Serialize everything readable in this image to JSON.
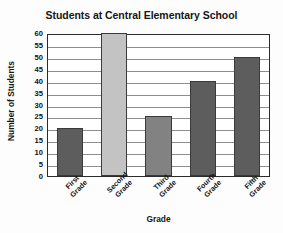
{
  "chart_data": {
    "type": "bar",
    "title": "Students at Central Elementary School",
    "xlabel": "Grade",
    "ylabel": "Number of Students",
    "categories": [
      "First Grade",
      "Second Grade",
      "Third Grade",
      "Fourth Grade",
      "Fifth Grade"
    ],
    "category_lines": [
      [
        "First",
        "Grade"
      ],
      [
        "Second",
        "Grade"
      ],
      [
        "Third",
        "Grade"
      ],
      [
        "Fourth",
        "Grade"
      ],
      [
        "Fifth",
        "Grade"
      ]
    ],
    "values": [
      20,
      60,
      25,
      40,
      50
    ],
    "bar_colors": [
      "#5d5d5d",
      "#c3c3c3",
      "#828282",
      "#5d5d5d",
      "#5d5d5d"
    ],
    "ylim": [
      0,
      60
    ],
    "ytick_step": 5,
    "yticks": [
      0,
      5,
      10,
      15,
      20,
      25,
      30,
      35,
      40,
      45,
      50,
      55,
      60
    ],
    "ytick_labels": [
      "0",
      "5",
      "10",
      "15",
      "20",
      "25",
      "30",
      "35",
      "40",
      "45",
      "50",
      "55",
      "60"
    ],
    "grid": true,
    "grid_axis": "y",
    "grid_color": "#8d8d8d",
    "legend": false,
    "axis_color": "#2b2b2b",
    "background": "#ffffff",
    "xtick_label_rotation": -45
  }
}
